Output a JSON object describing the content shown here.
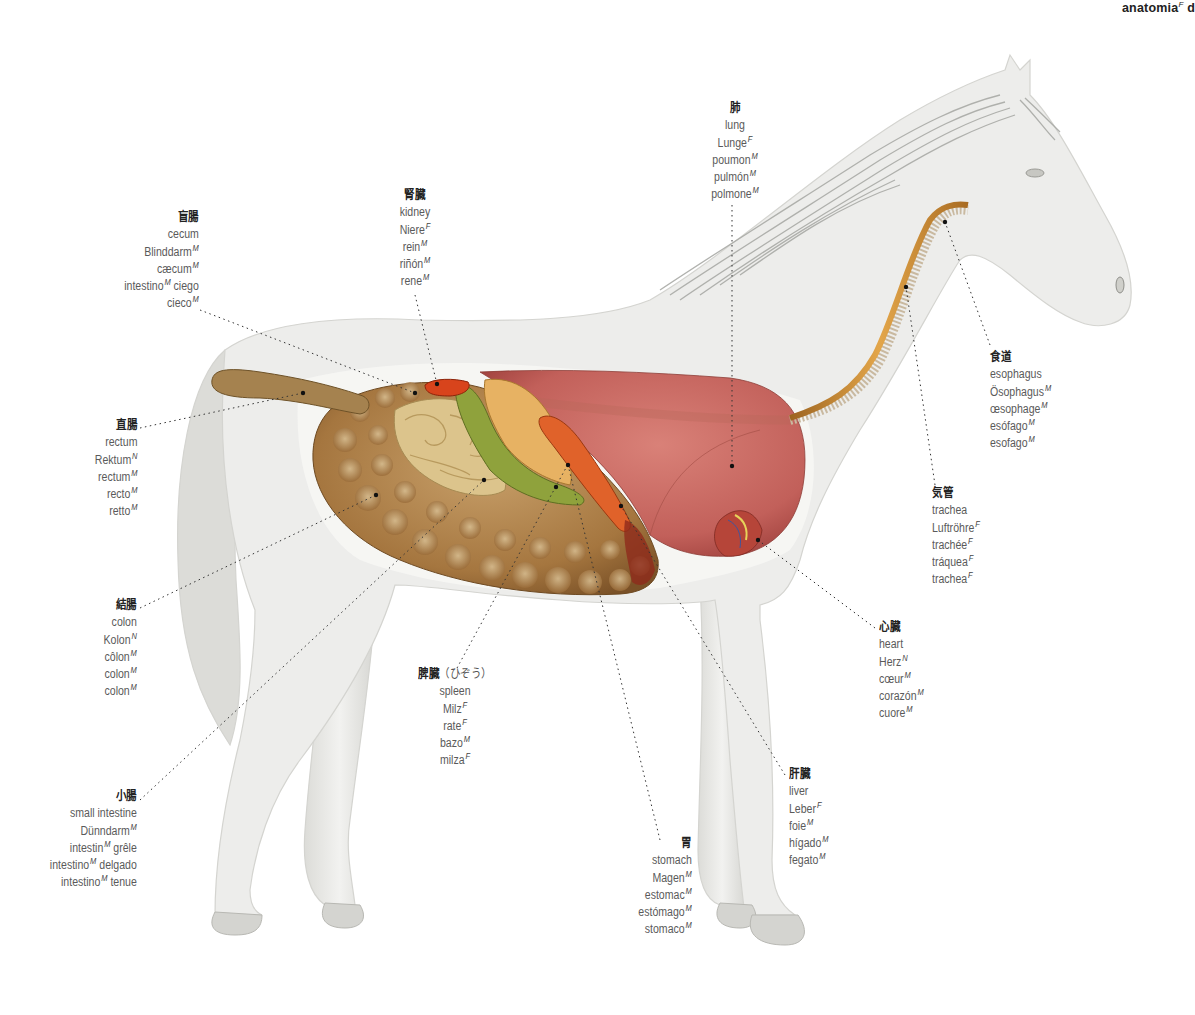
{
  "header": {
    "title": "anatomia",
    "gender": "F",
    "trailing": "d"
  },
  "illustration": {
    "subject": "horse internal anatomy (lateral view)",
    "colors": {
      "body": "#ececea",
      "body_shade": "#d4d4d1",
      "mane": "#a9aaa6",
      "intestine": "#a5763f",
      "small_intestine": "#dcc48c",
      "cecum_green": "#8fa23c",
      "stomach": "#e7b263",
      "spleen": "#e0622a",
      "kidney": "#d8441c",
      "lung": "#c96a62",
      "esophagus": "#c98a2c",
      "leader_line": "#333333"
    }
  },
  "labels": {
    "cecum": {
      "jp": "盲腸",
      "lines": [
        {
          "t": "cecum"
        },
        {
          "t": "Blinddarm",
          "g": "M"
        },
        {
          "t": "cæcum",
          "g": "M"
        },
        {
          "t": "intestino",
          "g": "M",
          "after": " ciego"
        },
        {
          "t": "cieco",
          "g": "M"
        }
      ]
    },
    "kidney": {
      "jp": "腎臓",
      "lines": [
        {
          "t": "kidney"
        },
        {
          "t": "Niere",
          "g": "F"
        },
        {
          "t": "rein",
          "g": "M"
        },
        {
          "t": "riñón",
          "g": "M"
        },
        {
          "t": "rene",
          "g": "M"
        }
      ]
    },
    "lung": {
      "jp": "肺",
      "lines": [
        {
          "t": "lung"
        },
        {
          "t": "Lunge",
          "g": "F"
        },
        {
          "t": "poumon",
          "g": "M"
        },
        {
          "t": "pulmón",
          "g": "M"
        },
        {
          "t": "polmone",
          "g": "M"
        }
      ]
    },
    "esophagus": {
      "jp": "食道",
      "lines": [
        {
          "t": "esophagus"
        },
        {
          "t": "Ösophagus",
          "g": "M"
        },
        {
          "t": "œsophage",
          "g": "M"
        },
        {
          "t": "esófago",
          "g": "M"
        },
        {
          "t": "esofago",
          "g": "M"
        }
      ]
    },
    "trachea": {
      "jp": "気管",
      "lines": [
        {
          "t": "trachea"
        },
        {
          "t": "Luftröhre",
          "g": "F"
        },
        {
          "t": "trachée",
          "g": "F"
        },
        {
          "t": "tráquea",
          "g": "F"
        },
        {
          "t": "trachea",
          "g": "F"
        }
      ]
    },
    "rectum": {
      "jp": "直腸",
      "lines": [
        {
          "t": "rectum"
        },
        {
          "t": "Rektum",
          "g": "N"
        },
        {
          "t": "rectum",
          "g": "M"
        },
        {
          "t": "recto",
          "g": "M"
        },
        {
          "t": "retto",
          "g": "M"
        }
      ]
    },
    "colon": {
      "jp": "結腸",
      "lines": [
        {
          "t": "colon"
        },
        {
          "t": "Kolon",
          "g": "N"
        },
        {
          "t": "côlon",
          "g": "M"
        },
        {
          "t": "colon",
          "g": "M"
        },
        {
          "t": "colon",
          "g": "M"
        }
      ]
    },
    "heart": {
      "jp": "心臓",
      "lines": [
        {
          "t": "heart"
        },
        {
          "t": "Herz",
          "g": "N"
        },
        {
          "t": "cœur",
          "g": "M"
        },
        {
          "t": "corazón",
          "g": "M"
        },
        {
          "t": "cuore",
          "g": "M"
        }
      ]
    },
    "spleen": {
      "jp": "脾臓",
      "jp_kana": "（ひぞう）",
      "lines": [
        {
          "t": "spleen"
        },
        {
          "t": "Milz",
          "g": "F"
        },
        {
          "t": "rate",
          "g": "F"
        },
        {
          "t": "bazo",
          "g": "M"
        },
        {
          "t": "milza",
          "g": "F"
        }
      ]
    },
    "liver": {
      "jp": "肝臓",
      "lines": [
        {
          "t": "liver"
        },
        {
          "t": "Leber",
          "g": "F"
        },
        {
          "t": "foie",
          "g": "M"
        },
        {
          "t": "hígado",
          "g": "M"
        },
        {
          "t": "fegato",
          "g": "M"
        }
      ]
    },
    "small_intestine": {
      "jp": "小腸",
      "lines": [
        {
          "t": "small intestine"
        },
        {
          "t": "Dünndarm",
          "g": "M"
        },
        {
          "t": "intestin",
          "g": "M",
          "after": " grêle"
        },
        {
          "t": "intestino",
          "g": "M",
          "after": " delgado"
        },
        {
          "t": "intestino",
          "g": "M",
          "after": " tenue"
        }
      ]
    },
    "stomach": {
      "jp": "胃",
      "lines": [
        {
          "t": "stomach"
        },
        {
          "t": "Magen",
          "g": "M"
        },
        {
          "t": "estomac",
          "g": "M"
        },
        {
          "t": "estómago",
          "g": "M"
        },
        {
          "t": "stomaco",
          "g": "M"
        }
      ]
    }
  }
}
